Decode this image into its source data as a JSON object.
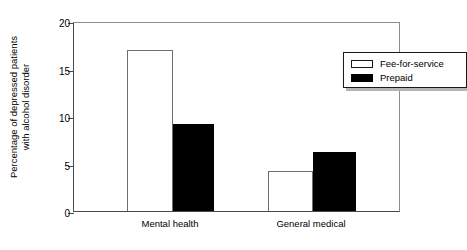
{
  "chart_data": {
    "type": "bar",
    "title": "",
    "xlabel": "",
    "ylabel_line1": "Percentage of depressed patients",
    "ylabel_line2": "with alcohol disorder",
    "categories": [
      "Mental health",
      "General medical"
    ],
    "series": [
      {
        "name": "Fee-for-service",
        "style": "open",
        "values": [
          17.0,
          4.2
        ]
      },
      {
        "name": "Prepaid",
        "style": "filled",
        "values": [
          9.2,
          6.2
        ]
      }
    ],
    "ylim": [
      0,
      20
    ],
    "yticks": [
      0,
      5,
      10,
      15,
      20
    ],
    "ytick_labels": [
      "0",
      "5",
      "10",
      "15",
      "20"
    ],
    "grid": false,
    "legend_position": "top-right",
    "colors": {
      "open_fill": "#ffffff",
      "open_edge": "#6e6e6e",
      "filled_fill": "#000000",
      "axis": "#4a4a4a",
      "frame": "#8c8c8c",
      "text": "#000000",
      "legend_shadow": "#b5b5b5"
    }
  }
}
